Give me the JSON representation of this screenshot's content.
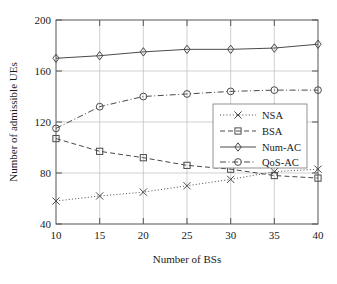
{
  "chart_data": {
    "type": "line",
    "title": "",
    "xlabel": "Number of BSs",
    "ylabel": "Number of admissible UEs",
    "x": [
      10,
      15,
      20,
      25,
      30,
      35,
      40
    ],
    "xtick_labels": [
      "10",
      "15",
      "20",
      "25",
      "30",
      "35",
      "40"
    ],
    "ytick_labels": [
      "40",
      "80",
      "120",
      "160",
      "200"
    ],
    "yticks": [
      40,
      80,
      120,
      160,
      200
    ],
    "ylim": [
      40,
      200
    ],
    "grid": true,
    "legend_position": "center-right",
    "series": [
      {
        "name": "NSA",
        "values": [
          58,
          62,
          65,
          70,
          75,
          81,
          83
        ],
        "marker": "x",
        "linestyle": "dotted",
        "color": "#4a4a4a"
      },
      {
        "name": "BSA",
        "values": [
          107,
          97,
          92,
          86,
          83,
          78,
          76
        ],
        "marker": "square",
        "linestyle": "dashed",
        "color": "#9a9a9a"
      },
      {
        "name": "Num-AC",
        "values": [
          170,
          172,
          175,
          177,
          177,
          178,
          181
        ],
        "marker": "diamond",
        "linestyle": "solid",
        "color": "#6a6a6a"
      },
      {
        "name": "QoS-AC",
        "values": [
          115,
          132,
          140,
          142,
          144,
          145,
          145
        ],
        "marker": "circle",
        "linestyle": "dashdot",
        "color": "#6a6a6a"
      }
    ]
  },
  "legend": {
    "entries": [
      {
        "label": "NSA"
      },
      {
        "label": "BSA"
      },
      {
        "label": "Num-AC"
      },
      {
        "label": "QoS-AC"
      }
    ]
  },
  "axes": {
    "x_title": "Number of BSs",
    "y_title": "Number of admissible UEs"
  }
}
